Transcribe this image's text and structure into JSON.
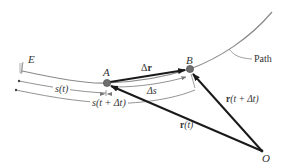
{
  "diagram": {
    "colors": {
      "path": "#8a8a8a",
      "vector": "#1a1a1a",
      "dimension": "#777777",
      "point_fill": "#6e6e6e",
      "text": "#333333"
    },
    "points": {
      "E": {
        "label": "E",
        "x": 22,
        "y": 70
      },
      "A": {
        "label": "A",
        "x": 107,
        "y": 83
      },
      "B": {
        "label": "B",
        "x": 190,
        "y": 69
      },
      "O": {
        "label": "O",
        "x": 262,
        "y": 151
      }
    },
    "labels": {
      "path": "Path",
      "delta_r_prefix": "Δ",
      "delta_r_vec": "r",
      "delta_s": "Δs",
      "s_t": "s(t)",
      "s_t_dt": "s(t + Δt)",
      "r_t_vec": "r",
      "r_t_arg": "(t)",
      "r_t_dt_vec": "r",
      "r_t_dt_arg": "(t + Δt)"
    },
    "vectors": [
      {
        "name": "r(t)",
        "from": "O",
        "to": "A"
      },
      {
        "name": "r(t + Δt)",
        "from": "O",
        "to": "B"
      },
      {
        "name": "Δr",
        "from": "A",
        "to": "B"
      }
    ],
    "dimensions": [
      {
        "name": "s(t)",
        "from": "E",
        "to": "A"
      },
      {
        "name": "s(t + Δt)",
        "from": "E",
        "to": "B"
      },
      {
        "name": "Δs",
        "from": "A",
        "to": "B"
      }
    ]
  }
}
